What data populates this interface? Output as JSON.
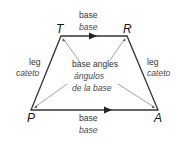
{
  "vertices": {
    "T": {
      "label": "T",
      "x": 61,
      "y": 36
    },
    "R": {
      "label": "R",
      "x": 127,
      "y": 36
    },
    "P": {
      "label": "P",
      "x": 31,
      "y": 110
    },
    "A": {
      "label": "A",
      "x": 158,
      "y": 110
    }
  },
  "labels": {
    "top_base_en": "base",
    "top_base_es": "base",
    "bottom_base_en": "base",
    "bottom_base_es": "base",
    "left_leg_en": "leg",
    "left_leg_es": "cateto",
    "right_leg_en": "leg",
    "right_leg_es": "cateto",
    "angles_en": "base angles",
    "angles_es_line1": "ángulos",
    "angles_es_line2": "de la base"
  },
  "colors": {
    "stroke": "#333333",
    "pointer": "#888888"
  }
}
